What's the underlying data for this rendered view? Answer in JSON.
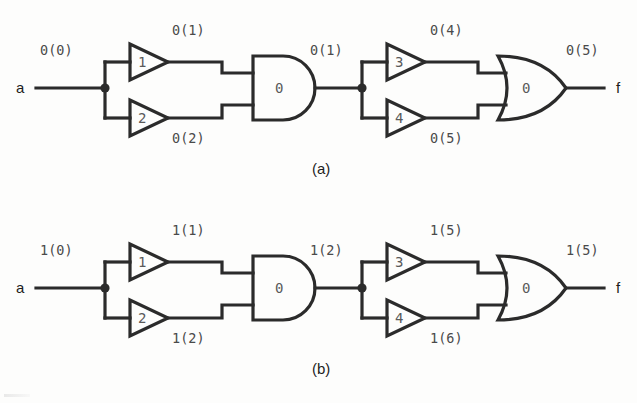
{
  "figure": {
    "type": "logic-circuit-timing-diagram",
    "background_color": "#fdfdfc",
    "line_color": "#2b2b2b",
    "label_color": "#4a4a4a"
  },
  "panels": [
    {
      "id": "a",
      "caption": "(a)",
      "input_port": "a",
      "output_port": "f",
      "input_signal": "0(0)",
      "stage1": {
        "buffers": [
          {
            "id": "1",
            "number": "1",
            "output_signal": "0(1)"
          },
          {
            "id": "2",
            "number": "2",
            "output_signal": "0(2)"
          }
        ],
        "gate": {
          "kind": "and-gate",
          "delay": "0"
        },
        "gate_output_signal": "0(1)"
      },
      "stage2": {
        "buffers": [
          {
            "id": "3",
            "number": "3",
            "output_signal": "0(4)"
          },
          {
            "id": "4",
            "number": "4",
            "output_signal": "0(5)"
          }
        ],
        "gate": {
          "kind": "or-gate",
          "delay": "0"
        },
        "gate_output_signal": "0(5)"
      }
    },
    {
      "id": "b",
      "caption": "(b)",
      "input_port": "a",
      "output_port": "f",
      "input_signal": "1(0)",
      "stage1": {
        "buffers": [
          {
            "id": "1",
            "number": "1",
            "output_signal": "1(1)"
          },
          {
            "id": "2",
            "number": "2",
            "output_signal": "1(2)"
          }
        ],
        "gate": {
          "kind": "and-gate",
          "delay": "0"
        },
        "gate_output_signal": "1(2)"
      },
      "stage2": {
        "buffers": [
          {
            "id": "3",
            "number": "3",
            "output_signal": "1(5)"
          },
          {
            "id": "4",
            "number": "4",
            "output_signal": "1(6)"
          }
        ],
        "gate": {
          "kind": "or-gate",
          "delay": "0"
        },
        "gate_output_signal": "1(5)"
      }
    }
  ]
}
